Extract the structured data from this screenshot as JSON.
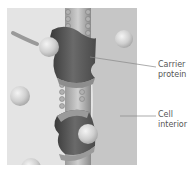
{
  "figure": {
    "regions": {
      "exterior_color": "#e6e6e6",
      "interior_color": "#c4c4c4",
      "protein_color": "#555555",
      "sphere_color": "#d2d2d2"
    }
  },
  "labels": {
    "carrier_protein": {
      "line1": "Carrier",
      "line2": "protein"
    },
    "cell_interior": {
      "line1": "Cell",
      "line2": "interior"
    }
  }
}
